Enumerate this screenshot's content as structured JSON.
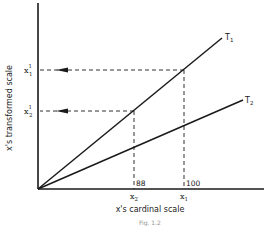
{
  "diagram": {
    "title": "",
    "x_axis_label": "x's cardinal scale",
    "y_axis_label": "x's transformed scale",
    "lines": [
      {
        "name": "T",
        "subscript": "1",
        "description": "steeper transformation line"
      },
      {
        "name": "T",
        "subscript": "2",
        "description": "shallower transformation line"
      }
    ],
    "x_marks": [
      {
        "symbol": "x",
        "subscript": "2",
        "value_label": "88"
      },
      {
        "symbol": "x",
        "subscript": "1",
        "value_label": "100"
      }
    ],
    "y_marks": [
      {
        "symbol": "x",
        "subscript": "1",
        "superscript": "1"
      },
      {
        "symbol": "x",
        "subscript": "2",
        "superscript": "1"
      }
    ],
    "caption_fragment": "Fig. 1.2"
  }
}
